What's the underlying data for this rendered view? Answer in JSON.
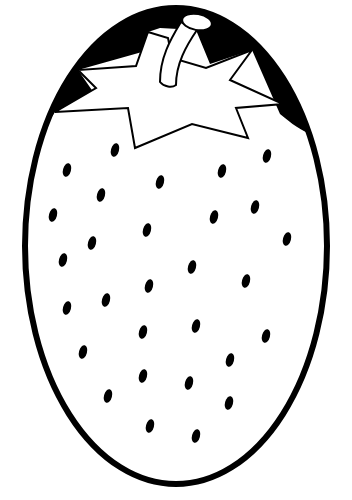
{
  "image": {
    "subject": "strawberry coloring page",
    "width": 352,
    "height": 500,
    "background": "#ffffff",
    "ink_color": "#000000",
    "fill_color": "#ffffff"
  },
  "body": {
    "cx": 176,
    "cy": 246,
    "rx": 151,
    "ry": 238,
    "stroke_width": 6
  },
  "cap": {
    "path": "M35,142 C 55,70 110,14 176,9 C 245,12 300,72 318,138 C 300,130 292,124 280,114 L 252,50 L 210,64 L 196,30 L 160,28 L 148,32 L 142,52 L 78,70 L 96,96 L 55,112 Z"
  },
  "crown": {
    "path": "M148,32 L 168,38 L 172,58 L 206,68 L 252,50 L 230,80 L 283,104 L 236,108 L 248,138 L 192,124 L 135,148 L 128,108 L 55,112 L 96,88 L 78,70 L 136,66 Z",
    "stroke_width": 2
  },
  "stem": {
    "path": "M181,22 C 170,40 160,58 160,82 C 164,87 172,88 176,85 C 176,64 186,46 197,30 Z",
    "cap_ellipse": {
      "cx": 197,
      "cy": 22,
      "rx": 15,
      "ry": 8,
      "rotate": 10
    }
  },
  "seeds": [
    {
      "x": 115,
      "y": 150
    },
    {
      "x": 67,
      "y": 170
    },
    {
      "x": 160,
      "y": 182
    },
    {
      "x": 101,
      "y": 195
    },
    {
      "x": 53,
      "y": 215
    },
    {
      "x": 147,
      "y": 230
    },
    {
      "x": 92,
      "y": 243
    },
    {
      "x": 267,
      "y": 156
    },
    {
      "x": 222,
      "y": 171
    },
    {
      "x": 255,
      "y": 207
    },
    {
      "x": 214,
      "y": 217
    },
    {
      "x": 287,
      "y": 239
    },
    {
      "x": 63,
      "y": 260
    },
    {
      "x": 192,
      "y": 267
    },
    {
      "x": 246,
      "y": 281
    },
    {
      "x": 149,
      "y": 286
    },
    {
      "x": 106,
      "y": 300
    },
    {
      "x": 67,
      "y": 308
    },
    {
      "x": 196,
      "y": 326
    },
    {
      "x": 143,
      "y": 332
    },
    {
      "x": 266,
      "y": 336
    },
    {
      "x": 83,
      "y": 352
    },
    {
      "x": 230,
      "y": 360
    },
    {
      "x": 143,
      "y": 376
    },
    {
      "x": 189,
      "y": 383
    },
    {
      "x": 108,
      "y": 396
    },
    {
      "x": 229,
      "y": 403
    },
    {
      "x": 150,
      "y": 426
    },
    {
      "x": 196,
      "y": 436
    }
  ],
  "seed_shape": {
    "rx": 4,
    "ry": 7,
    "rotate": 15
  }
}
